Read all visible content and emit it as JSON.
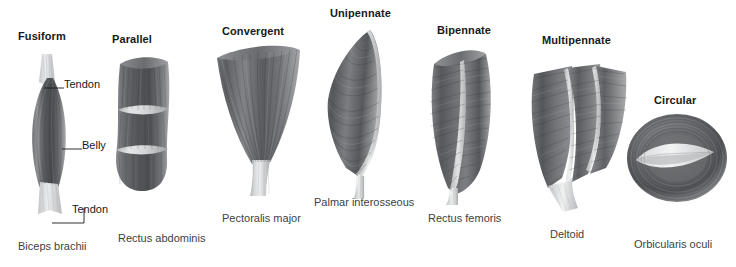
{
  "figure": {
    "background": "#ffffff",
    "muscle_tone_dark": "#4a4c4f",
    "muscle_tone_mid": "#7d7f82",
    "muscle_tone_light": "#c9cbcd",
    "tendon_tone": "#e8e9ea",
    "text_color": "#17181a",
    "caption_color": "#3d3f42"
  },
  "types": [
    {
      "id": "fusiform",
      "header": "Fusiform",
      "caption": "Biceps brachii",
      "callouts": [
        {
          "label": "Tendon",
          "position": "upper"
        },
        {
          "label": "Belly",
          "position": "middle"
        },
        {
          "label": "Tendon",
          "position": "lower"
        }
      ]
    },
    {
      "id": "parallel",
      "header": "Parallel",
      "caption": "Rectus abdominis",
      "callouts": []
    },
    {
      "id": "convergent",
      "header": "Convergent",
      "caption": "Pectoralis major",
      "callouts": []
    },
    {
      "id": "unipennate",
      "header": "Unipennate",
      "caption": "Palmar interosseous",
      "callouts": []
    },
    {
      "id": "bipennate",
      "header": "Bipennate",
      "caption": "Rectus femoris",
      "callouts": []
    },
    {
      "id": "multipennate",
      "header": "Multipennate",
      "caption": "Deltoid",
      "callouts": []
    },
    {
      "id": "circular",
      "header": "Circular",
      "caption": "Orbicularis oculi",
      "callouts": []
    }
  ]
}
